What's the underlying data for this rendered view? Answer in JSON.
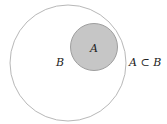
{
  "diagram": {
    "type": "venn",
    "outer_set": {
      "label": "B",
      "fill": "#ffffff",
      "stroke": "#b0b0b0"
    },
    "inner_set": {
      "label": "A",
      "fill": "#c8c8c8",
      "stroke": "#9a9a9a"
    },
    "relation_label": "A ⊂ B"
  }
}
